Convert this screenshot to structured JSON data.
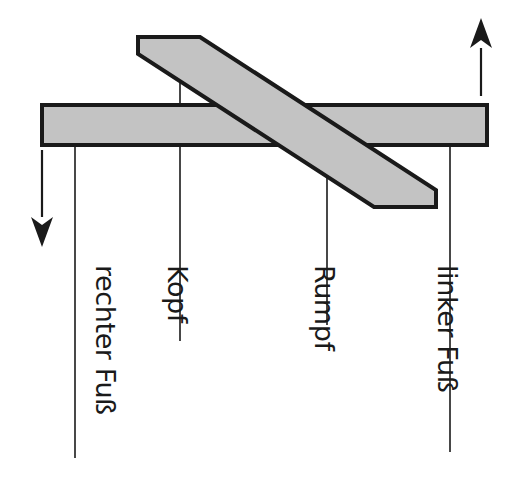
{
  "figure": {
    "background_color": "#ffffff",
    "ink_color": "#1a1a1a",
    "bar_fill_color": "#c3c3c3",
    "bar_stroke_color": "#1a1a1a"
  },
  "bars": {
    "horizontal": {
      "name": "horizontal bar",
      "fill": "#c3c3c3",
      "stroke": "#1a1a1a",
      "points": "42,105 487,105 487,145 42,145"
    },
    "diagonal": {
      "name": "diagonal bar",
      "fill": "#c3c3c3",
      "stroke": "#1a1a1a",
      "points": "138,37 200,37 436,190 436,207 374,207 138,54"
    }
  },
  "arrows": [
    {
      "name": "down-arrow",
      "direction": "down",
      "x": 42,
      "y_start": 150,
      "y_end": 247,
      "color": "#1a1a1a"
    },
    {
      "name": "up-arrow",
      "direction": "up",
      "x": 481,
      "y_start": 96,
      "y_end": 18,
      "color": "#1a1a1a"
    }
  ],
  "leaders": [
    {
      "name": "leader-rechter-fuss",
      "x": 75,
      "y_top": 146,
      "y_bottom": 458
    },
    {
      "name": "leader-kopf",
      "x": 180,
      "y_top": 42,
      "y_bottom": 341
    },
    {
      "name": "leader-rumpf",
      "x": 327,
      "y_top": 153,
      "y_bottom": 325
    },
    {
      "name": "leader-linker-fuss",
      "x": 450,
      "y_top": 146,
      "y_bottom": 452
    }
  ],
  "labels": [
    {
      "name": "label-rechter-fuss",
      "text": "rechter Fuß",
      "x": 96,
      "y": 265,
      "rotation": 90
    },
    {
      "name": "label-kopf",
      "text": "Kopf",
      "x": 168,
      "y": 265,
      "rotation": 90
    },
    {
      "name": "label-rumpf",
      "text": "Rumpf",
      "x": 315,
      "y": 265,
      "rotation": 90
    },
    {
      "name": "label-linker-fuss",
      "text": "linker Fuß",
      "x": 438,
      "y": 265,
      "rotation": 90
    }
  ]
}
